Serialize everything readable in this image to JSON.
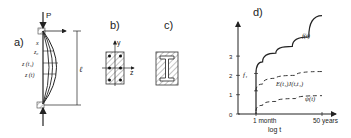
{
  "panels": {
    "a": {
      "label": "a)",
      "load_label": "P",
      "length_label": "ℓ",
      "x_label": "x",
      "z0_label": "z₀",
      "zt1_label": "z (t₁)",
      "zt_label": "z (t)"
    },
    "b": {
      "label": "b)",
      "y_axis_label": "y",
      "z_axis_label": "z"
    },
    "c": {
      "label": "c)"
    },
    "d": {
      "label": "d)"
    }
  },
  "chart_data": {
    "type": "line",
    "title": "d)",
    "xlabel": "log t",
    "ylabel": "",
    "x_tick_labels": [
      "1 month",
      "50 years"
    ],
    "y_tick_labels": [
      "0",
      "1",
      "2",
      "3"
    ],
    "ylim": [
      0,
      4
    ],
    "annotations": [
      "f₁"
    ],
    "series": [
      {
        "name": "f(t)",
        "style": "solid",
        "points": [
          [
            0,
            0
          ],
          [
            0,
            2.1
          ],
          [
            0.1,
            2.7
          ],
          [
            0.3,
            3.15
          ],
          [
            0.55,
            3.5
          ],
          [
            0.8,
            4.0
          ],
          [
            1.0,
            5.1
          ]
        ]
      },
      {
        "name": "E(t₁)J(t,t₁)",
        "style": "dashed",
        "points": [
          [
            0,
            1.2
          ],
          [
            0.1,
            1.55
          ],
          [
            0.3,
            1.85
          ],
          [
            0.6,
            2.0
          ],
          [
            1.0,
            2.2
          ]
        ]
      },
      {
        "name": "ψ(t)",
        "style": "dashed",
        "points": [
          [
            0,
            0.15
          ],
          [
            0.1,
            0.45
          ],
          [
            0.3,
            0.65
          ],
          [
            0.6,
            0.8
          ],
          [
            1.0,
            0.95
          ]
        ]
      }
    ]
  }
}
